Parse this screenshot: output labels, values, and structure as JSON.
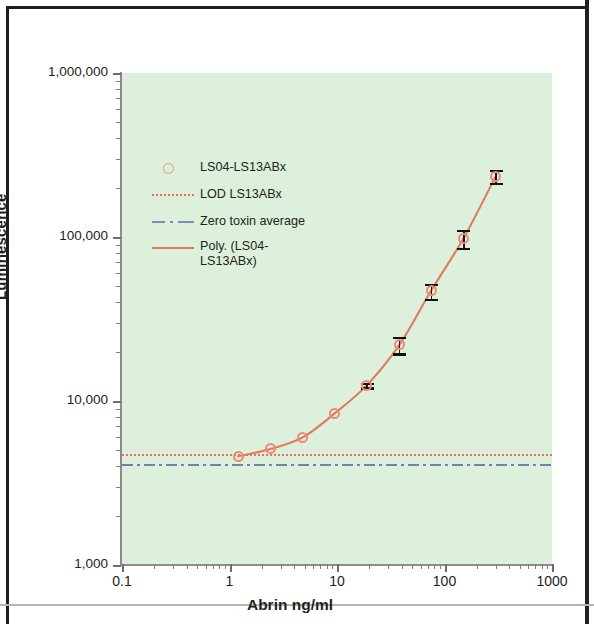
{
  "chart_data": {
    "type": "line",
    "title": "",
    "xlabel": "Abrin ng/ml",
    "ylabel": "Luminescence",
    "xscale": "log",
    "yscale": "log",
    "xlim": [
      0.1,
      1000
    ],
    "ylim": [
      1000,
      1000000
    ],
    "xticks": [
      "0.1",
      "1",
      "10",
      "100",
      "1000"
    ],
    "yticks": [
      "1,000",
      "10,000",
      "100,000",
      "1,000,000"
    ],
    "grid": false,
    "legend_position": "inside-upper-left",
    "plot_background": "#ddf0dc",
    "accent_color": "#e8735a",
    "marker_color": "#f08a72",
    "reference_color": "#6d83ab",
    "series": [
      {
        "name": "LS04-LS13ABx",
        "style": "markers-with-error-bars",
        "marker": "open-circle",
        "color": "#f08a72",
        "x": [
          1.2,
          2.4,
          4.8,
          9.5,
          19,
          38,
          75,
          150,
          300
        ],
        "values": [
          4600,
          5100,
          6000,
          8400,
          12500,
          22000,
          47000,
          98000,
          235000
        ],
        "yerr_low": [
          0,
          0,
          0,
          0,
          400,
          2500,
          5000,
          12000,
          22000
        ],
        "yerr_high": [
          0,
          0,
          0,
          0,
          400,
          2500,
          5000,
          12000,
          22000
        ]
      },
      {
        "name": "Poly. (LS04-LS13ABx)",
        "style": "solid-trendline",
        "color": "#df7a5c"
      },
      {
        "name": "LOD LS13ABx",
        "style": "dotted-horizontal",
        "color": "#e8735a",
        "value": 4750
      },
      {
        "name": "Zero toxin average",
        "style": "dashdot-horizontal",
        "color": "#6d83ab",
        "value": 4150
      }
    ]
  },
  "axes": {
    "y_title": "Luminescence",
    "x_title": "Abrin ng/ml",
    "y_tick_labels": [
      "1,000,000",
      "100,000",
      "10,000",
      "1,000"
    ],
    "x_tick_labels": [
      "0.1",
      "1",
      "10",
      "100",
      "1000"
    ]
  },
  "legend": {
    "items": [
      {
        "label": "LS04-LS13ABx",
        "key": "open-circle-marker"
      },
      {
        "label": "LOD LS13ABx",
        "key": "dotted-line"
      },
      {
        "label": "Zero toxin average",
        "key": "dash-dot-line"
      },
      {
        "label": "Poly. (LS04-LS13ABx)",
        "key": "solid-line"
      }
    ]
  }
}
